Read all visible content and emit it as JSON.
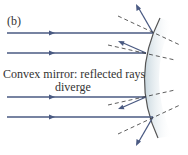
{
  "panel_label": "(b)",
  "caption_line1": "Convex mirror: reflected rays",
  "caption_line2": "diverge",
  "colors": {
    "ray": "#4a5a82",
    "mirror_edge": "#555",
    "mirror_fill": "#d6e2e8",
    "normal": "#333",
    "text": "#333"
  }
}
